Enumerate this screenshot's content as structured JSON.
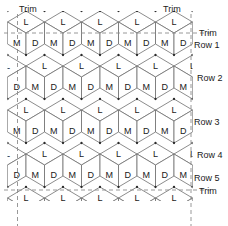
{
  "figure": {
    "background_color": "#ffffff",
    "line_color": "#6e6e6e",
    "vertex_color": "#2b2b2b",
    "trim_line_color": "#8c8c8c",
    "text_color": "#1a1a1a"
  },
  "labels": {
    "trim_top_left": "Trim",
    "trim_top_right": "Trim",
    "trim_right": "Trim",
    "trim_bottom_right": "Trim",
    "row_1": "Row 1",
    "row_2": "Row 2",
    "row_3": "Row 3",
    "row_4": "Row 4",
    "row_5": "Row 5"
  },
  "patch_codes": {
    "light": "L",
    "medium": "M",
    "dark": "D"
  },
  "geometry": {
    "cube_width": 37,
    "cube_half_width": 18.5,
    "rhombus_half_height": 11,
    "origin_x": 7.5,
    "origin_y": 11,
    "columns": 5,
    "rows": 6,
    "trim_left_x": 17.5,
    "trim_right_x": 191,
    "trim_top_y": 33,
    "trim_bottom_y": 190
  },
  "rows": [
    {
      "name": "Row 1",
      "label_y": 45,
      "faces": [
        "L",
        "M",
        "D"
      ]
    },
    {
      "name": "Row 2",
      "label_y": 78,
      "faces": [
        "L",
        "M",
        "D"
      ]
    },
    {
      "name": "Row 3",
      "label_y": 122,
      "faces": [
        "L",
        "M",
        "D"
      ]
    },
    {
      "name": "Row 4",
      "label_y": 155,
      "faces": [
        "L",
        "M",
        "D"
      ]
    },
    {
      "name": "Row 5",
      "label_y": 178,
      "faces": [
        "L",
        "M",
        "D"
      ]
    }
  ],
  "chart_data": {
    "type": "diagram",
    "patch_legend": [
      {
        "code": "L",
        "name": "Light",
        "face": "top"
      },
      {
        "code": "M",
        "name": "Medium",
        "face": "left"
      },
      {
        "code": "D",
        "name": "Dark",
        "face": "right"
      }
    ],
    "row_labels": [
      "Row 1",
      "Row 2",
      "Row 3",
      "Row 4",
      "Row 5"
    ],
    "trim_labels": [
      "Trim",
      "Trim",
      "Trim",
      "Trim"
    ],
    "counts": {
      "rows": 5,
      "full_cubes_per_row": 4,
      "letters_per_cube": 3
    }
  }
}
